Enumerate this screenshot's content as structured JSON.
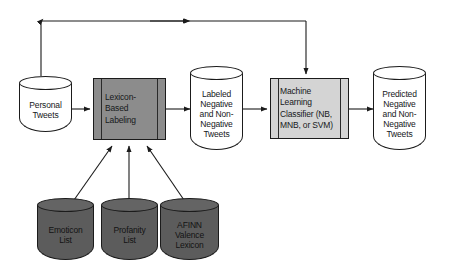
{
  "diagram": {
    "background": "#ffffff",
    "stroke": "#1b1b1b",
    "colors": {
      "lexicon_box_fill": "#8c8c8c",
      "classifier_box_fill": "#d4d4d4",
      "source_cylinder_fill": "#5c5c5c",
      "data_cylinder_fill": "#ffffff"
    }
  },
  "nodes": {
    "personal_tweets": {
      "label": "Personal\nTweets",
      "lines": [
        "Personal",
        "Tweets"
      ],
      "shape": "cylinder",
      "style": "light"
    },
    "lexicon_labeling": {
      "label": "Lexicon-Based Labeling",
      "lines": [
        "Lexicon-",
        "Based",
        "Labeling"
      ],
      "shape": "process",
      "style": "dark"
    },
    "labeled_tweets": {
      "label": "Labeled Negative and Non-Negative Tweets",
      "lines": [
        "Labeled",
        "Negative",
        "and Non-",
        "Negative",
        "Tweets"
      ],
      "shape": "cylinder",
      "style": "light"
    },
    "ml_classifier": {
      "label": "Machine Learning Classifier (NB, MNB, or SVM)",
      "lines": [
        "Machine",
        "Learning",
        "Classifier (NB,",
        "MNB, or SVM)"
      ],
      "shape": "process",
      "style": "light"
    },
    "predicted_tweets": {
      "label": "Predicted Negative and Non-Negative Tweets",
      "lines": [
        "Predicted",
        "Negative",
        "and Non-",
        "Negative",
        "Tweets"
      ],
      "shape": "cylinder",
      "style": "light"
    },
    "emoticon_list": {
      "label": "Emoticon List",
      "lines": [
        "Emoticon",
        "List"
      ],
      "shape": "cylinder",
      "style": "dark"
    },
    "profanity_list": {
      "label": "Profanity List",
      "lines": [
        "Profanity",
        "List"
      ],
      "shape": "cylinder",
      "style": "dark"
    },
    "afinn_lexicon": {
      "label": "AFINN Valence Lexicon",
      "lines": [
        "AFINN",
        "Valence",
        "Lexicon"
      ],
      "shape": "cylinder",
      "style": "dark"
    }
  },
  "edges": [
    {
      "from": "personal_tweets",
      "to": "lexicon_labeling",
      "kind": "arrow"
    },
    {
      "from": "lexicon_labeling",
      "to": "labeled_tweets",
      "kind": "arrow"
    },
    {
      "from": "labeled_tweets",
      "to": "ml_classifier",
      "kind": "arrow"
    },
    {
      "from": "ml_classifier",
      "to": "predicted_tweets",
      "kind": "arrow"
    },
    {
      "from": "emoticon_list",
      "to": "lexicon_labeling",
      "kind": "arrow"
    },
    {
      "from": "profanity_list",
      "to": "lexicon_labeling",
      "kind": "arrow"
    },
    {
      "from": "afinn_lexicon",
      "to": "lexicon_labeling",
      "kind": "arrow"
    },
    {
      "from": "personal_tweets",
      "to": "ml_classifier",
      "kind": "feedback-loop"
    }
  ]
}
